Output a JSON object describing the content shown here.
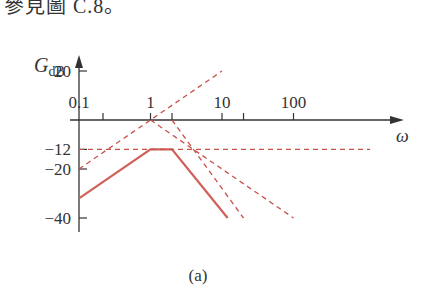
{
  "header_text": "參見圖 C.8。",
  "caption": "(a)",
  "colors": {
    "axis": "#333333",
    "solid": "#d0605a",
    "dashed": "#c8504a"
  },
  "chart_data": {
    "type": "line",
    "title": "",
    "xlabel": "ω",
    "ylabel": "G_dB",
    "xscale": "log",
    "x_tick_labels": [
      "0.1",
      "1",
      "10",
      "100"
    ],
    "x_minor_ticks": [
      2,
      20
    ],
    "y_tick_labels": [
      "20",
      "-12",
      "-20",
      "-40"
    ],
    "y_ticks": [
      20,
      -12,
      -20,
      -40
    ],
    "xlim": [
      0.1,
      1000
    ],
    "ylim": [
      -45,
      30
    ],
    "grid": false,
    "legend": null,
    "series": [
      {
        "name": "Total asymptotic magnitude",
        "style": "solid",
        "x": [
          0.1,
          1,
          2,
          12
        ],
        "y": [
          -32,
          -12,
          -12,
          -40
        ]
      },
      {
        "name": "Constant -12 dB",
        "style": "dashed",
        "x": [
          0.1,
          500
        ],
        "y": [
          -12,
          -12
        ]
      },
      {
        "name": "+20 dB/dec (zero at origin)",
        "style": "dashed",
        "x": [
          0.1,
          10
        ],
        "y": [
          -20,
          20
        ]
      },
      {
        "name": "-20 dB/dec pole at ω=1",
        "style": "dashed",
        "x": [
          1,
          100
        ],
        "y": [
          0,
          -40
        ]
      },
      {
        "name": "-40 dB/dec poles at ω=2",
        "style": "dashed",
        "x": [
          2,
          20
        ],
        "y": [
          0,
          -40
        ]
      }
    ]
  },
  "axis": {
    "y_label_main": "G",
    "y_label_sub": "dB",
    "x_label": "ω"
  }
}
